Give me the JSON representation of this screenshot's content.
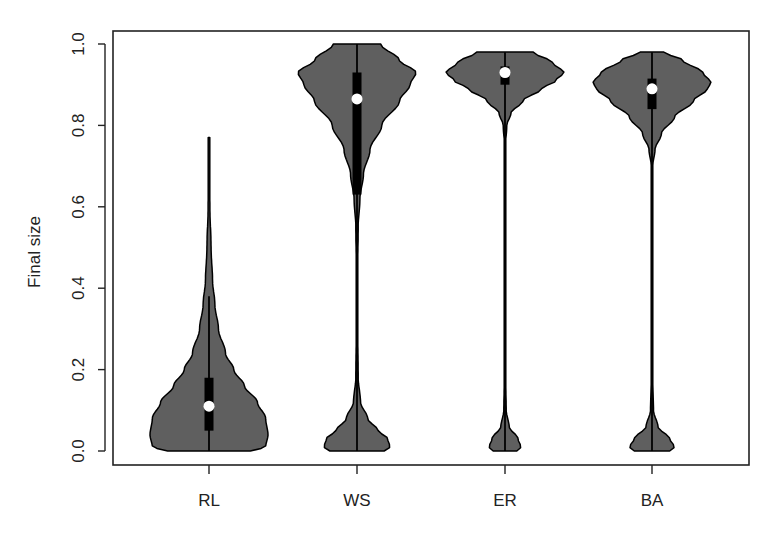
{
  "chart_data": {
    "type": "violin",
    "title": "",
    "xlabel": "",
    "ylabel": "Final size",
    "ylim": [
      0.0,
      1.0
    ],
    "yticks": [
      "0.0",
      "0.2",
      "0.4",
      "0.6",
      "0.8",
      "1.0"
    ],
    "ytick_values": [
      0.0,
      0.2,
      0.4,
      0.6,
      0.8,
      1.0
    ],
    "grid": false,
    "legend": "none",
    "categories": [
      "RL",
      "WS",
      "ER",
      "BA"
    ],
    "colors": {
      "violin_fill": "#5f5f5f",
      "outline": "#000000",
      "box": "#000000",
      "median": "#ffffff",
      "axis": "#222222"
    },
    "series": [
      {
        "name": "RL",
        "min": 0.0,
        "max": 0.77,
        "q1": 0.05,
        "median": 0.11,
        "q3": 0.18,
        "whisker_low": 0.0,
        "whisker_high": 0.38,
        "density": [
          [
            0.0,
            0.7
          ],
          [
            0.01,
            0.96
          ],
          [
            0.04,
            1.0
          ],
          [
            0.08,
            0.96
          ],
          [
            0.12,
            0.82
          ],
          [
            0.16,
            0.6
          ],
          [
            0.2,
            0.42
          ],
          [
            0.24,
            0.28
          ],
          [
            0.3,
            0.16
          ],
          [
            0.36,
            0.1
          ],
          [
            0.42,
            0.06
          ],
          [
            0.5,
            0.035
          ],
          [
            0.6,
            0.015
          ],
          [
            0.7,
            0.006
          ],
          [
            0.77,
            0.0
          ]
        ]
      },
      {
        "name": "WS",
        "min": 0.0,
        "max": 1.0,
        "q1": 0.63,
        "median": 0.865,
        "q3": 0.93,
        "whisker_low": 0.0,
        "whisker_high": 1.0,
        "density": [
          [
            0.0,
            0.46
          ],
          [
            0.01,
            0.56
          ],
          [
            0.03,
            0.52
          ],
          [
            0.05,
            0.36
          ],
          [
            0.08,
            0.18
          ],
          [
            0.12,
            0.06
          ],
          [
            0.18,
            0.02
          ],
          [
            0.3,
            0.012
          ],
          [
            0.45,
            0.012
          ],
          [
            0.55,
            0.02
          ],
          [
            0.62,
            0.05
          ],
          [
            0.68,
            0.11
          ],
          [
            0.74,
            0.22
          ],
          [
            0.8,
            0.42
          ],
          [
            0.86,
            0.72
          ],
          [
            0.9,
            0.9
          ],
          [
            0.93,
            1.0
          ],
          [
            0.96,
            0.72
          ],
          [
            1.0,
            0.4
          ]
        ]
      },
      {
        "name": "ER",
        "min": 0.0,
        "max": 0.98,
        "q1": 0.9,
        "median": 0.93,
        "q3": 0.945,
        "whisker_low": 0.0,
        "whisker_high": 0.98,
        "density": [
          [
            0.0,
            0.2
          ],
          [
            0.01,
            0.27
          ],
          [
            0.03,
            0.22
          ],
          [
            0.06,
            0.07
          ],
          [
            0.1,
            0.02
          ],
          [
            0.2,
            0.008
          ],
          [
            0.5,
            0.006
          ],
          [
            0.75,
            0.008
          ],
          [
            0.8,
            0.03
          ],
          [
            0.83,
            0.1
          ],
          [
            0.86,
            0.3
          ],
          [
            0.89,
            0.62
          ],
          [
            0.91,
            0.86
          ],
          [
            0.93,
            1.0
          ],
          [
            0.955,
            0.8
          ],
          [
            0.98,
            0.48
          ]
        ]
      },
      {
        "name": "BA",
        "min": 0.0,
        "max": 0.98,
        "q1": 0.84,
        "median": 0.89,
        "q3": 0.915,
        "whisker_low": 0.0,
        "whisker_high": 0.98,
        "density": [
          [
            0.0,
            0.3
          ],
          [
            0.01,
            0.38
          ],
          [
            0.03,
            0.3
          ],
          [
            0.06,
            0.1
          ],
          [
            0.1,
            0.025
          ],
          [
            0.2,
            0.008
          ],
          [
            0.5,
            0.006
          ],
          [
            0.7,
            0.012
          ],
          [
            0.74,
            0.05
          ],
          [
            0.78,
            0.16
          ],
          [
            0.82,
            0.38
          ],
          [
            0.86,
            0.7
          ],
          [
            0.89,
            0.94
          ],
          [
            0.905,
            1.0
          ],
          [
            0.93,
            0.86
          ],
          [
            0.96,
            0.52
          ],
          [
            0.98,
            0.2
          ]
        ]
      }
    ]
  }
}
